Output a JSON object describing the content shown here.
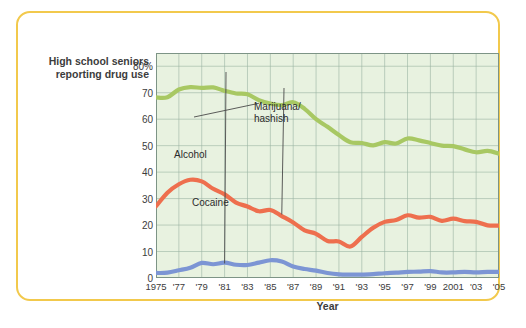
{
  "figure": {
    "y_axis_title": "High school\nseniors\nreporting\ndrug use",
    "x_axis_title": "Year"
  },
  "chart_data": {
    "type": "line",
    "title": "",
    "xlabel": "Year",
    "ylabel": "High school seniors reporting drug use",
    "xlim": [
      1975,
      2005
    ],
    "ylim": [
      0,
      85
    ],
    "yticks": [
      0,
      10,
      20,
      30,
      40,
      50,
      60,
      70,
      80
    ],
    "ytick_labels": [
      "0",
      "10",
      "20",
      "30",
      "40",
      "50",
      "60",
      "70",
      "80%"
    ],
    "xticks": [
      1975,
      1977,
      1979,
      1981,
      1983,
      1985,
      1987,
      1989,
      1991,
      1993,
      1995,
      1997,
      1999,
      2001,
      2003,
      2005
    ],
    "xtick_labels": [
      "1975",
      "'77",
      "'79",
      "'81",
      "'83",
      "'85",
      "'87",
      "'89",
      "'91",
      "'93",
      "'95",
      "'97",
      "'99",
      "2001",
      "'03",
      "'05"
    ],
    "grid": true,
    "legend_position": "inline-annotations",
    "plot_bg_color": "#e8f2e0",
    "grid_color": "#9ab3a2",
    "x": [
      1975,
      1976,
      1977,
      1978,
      1979,
      1980,
      1981,
      1982,
      1983,
      1984,
      1985,
      1986,
      1987,
      1988,
      1989,
      1990,
      1991,
      1992,
      1993,
      1994,
      1995,
      1996,
      1997,
      1998,
      1999,
      2000,
      2001,
      2002,
      2003,
      2004,
      2005
    ],
    "series": [
      {
        "name": "Alcohol",
        "color": "#a8c863",
        "values": [
          68.2,
          68.3,
          71.2,
          72.1,
          71.8,
          72.0,
          70.7,
          69.7,
          69.4,
          67.2,
          65.9,
          65.3,
          66.4,
          63.9,
          60.0,
          57.1,
          54.0,
          51.3,
          51.0,
          50.1,
          51.3,
          50.8,
          52.7,
          52.0,
          51.0,
          50.0,
          49.8,
          48.6,
          47.5,
          48.0,
          47.0
        ]
      },
      {
        "name": "Marijuana/\nhashish",
        "color": "#ee6f4e",
        "values": [
          27.1,
          32.2,
          35.4,
          37.1,
          36.5,
          33.7,
          31.6,
          28.5,
          27.0,
          25.2,
          25.7,
          23.4,
          21.0,
          18.0,
          16.7,
          14.0,
          13.8,
          11.9,
          15.5,
          19.0,
          21.2,
          21.9,
          23.7,
          22.8,
          23.1,
          21.6,
          22.4,
          21.5,
          21.2,
          19.9,
          19.8
        ]
      },
      {
        "name": "Cocaine",
        "color": "#7c95d4",
        "values": [
          1.9,
          2.0,
          2.9,
          3.9,
          5.7,
          5.2,
          5.8,
          5.0,
          4.9,
          5.8,
          6.7,
          6.2,
          4.3,
          3.4,
          2.8,
          1.9,
          1.4,
          1.3,
          1.3,
          1.5,
          1.8,
          2.0,
          2.3,
          2.4,
          2.6,
          2.1,
          2.1,
          2.3,
          2.1,
          2.3,
          2.3
        ]
      }
    ],
    "annotations": [
      {
        "label": "Alcohol",
        "target_year": 1984,
        "target_value": 66
      },
      {
        "label": "Marijuana/\nhashish",
        "target_year": 1986,
        "target_value": 24
      },
      {
        "label": "Cocaine",
        "target_year": 1981,
        "target_value": 5.5
      }
    ]
  }
}
